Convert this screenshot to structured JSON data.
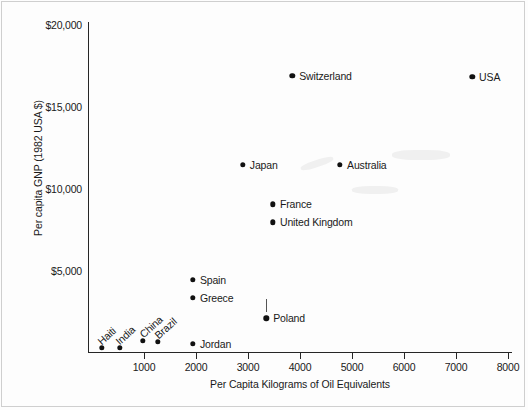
{
  "chart_data": {
    "type": "scatter",
    "title": "",
    "xlabel": "Per Capita Kilograms of Oil Equivalents",
    "ylabel": "Per capita GNP (1982 USA $)",
    "xlim": [
      0,
      8000
    ],
    "ylim": [
      0,
      20000
    ],
    "xticks": [
      1000,
      2000,
      3000,
      4000,
      5000,
      6000,
      7000,
      8000
    ],
    "xtick_labels": [
      "1000",
      "2000",
      "3000",
      "4000",
      "5000",
      "6000",
      "7000",
      "8000"
    ],
    "yticks": [
      5000,
      10000,
      15000,
      20000
    ],
    "ytick_labels": [
      "$5,000",
      "$10,000",
      "$15,000",
      "$20,000"
    ],
    "grid": false,
    "legend": "none",
    "marker_color": "#111111",
    "axis_color": "#262626",
    "points": [
      {
        "label": "Haiti",
        "x": 190,
        "y": 300,
        "label_rotated": true,
        "label_dx": 1,
        "label_dy": -7
      },
      {
        "label": "India",
        "x": 540,
        "y": 300,
        "label_rotated": true,
        "label_dx": 1,
        "label_dy": -7
      },
      {
        "label": "China",
        "x": 980,
        "y": 700,
        "label_rotated": true,
        "label_dx": 2,
        "label_dy": -7
      },
      {
        "label": "Brazil",
        "x": 1270,
        "y": 640,
        "label_rotated": true,
        "label_dx": 2,
        "label_dy": -7
      },
      {
        "label": "Jordan",
        "x": 1940,
        "y": 520,
        "label_rotated": false,
        "label_dx": 7,
        "label_dy": 0
      },
      {
        "label": "Poland",
        "x": 3350,
        "y": 2100,
        "label_rotated": false,
        "label_dx": 7,
        "label_dy": 0
      },
      {
        "label": "Greece",
        "x": 1940,
        "y": 3350,
        "label_rotated": false,
        "label_dx": 7,
        "label_dy": 0
      },
      {
        "label": "Spain",
        "x": 1940,
        "y": 4450,
        "label_rotated": false,
        "label_dx": 7,
        "label_dy": 0
      },
      {
        "label": "United Kingdom",
        "x": 3480,
        "y": 7950,
        "label_rotated": false,
        "label_dx": 7,
        "label_dy": 0
      },
      {
        "label": "France",
        "x": 3480,
        "y": 9050,
        "label_rotated": false,
        "label_dx": 7,
        "label_dy": 0
      },
      {
        "label": "Japan",
        "x": 2900,
        "y": 11450,
        "label_rotated": false,
        "label_dx": 7,
        "label_dy": 0
      },
      {
        "label": "Australia",
        "x": 4770,
        "y": 11450,
        "label_rotated": false,
        "label_dx": 7,
        "label_dy": 0
      },
      {
        "label": "Switzerland",
        "x": 3850,
        "y": 16900,
        "label_rotated": false,
        "label_dx": 7,
        "label_dy": 0
      },
      {
        "label": "USA",
        "x": 7310,
        "y": 16850,
        "label_rotated": false,
        "label_dx": 7,
        "label_dy": 0
      }
    ]
  }
}
